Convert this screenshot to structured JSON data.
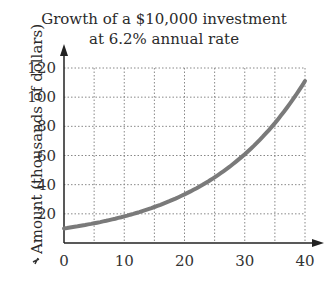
{
  "chart_data": {
    "type": "line",
    "title": "Growth of a $10,000 investment",
    "subtitle": "at 6.2% annual rate",
    "xlabel": "",
    "ylabel": "Amount (thousands of dollars)",
    "x_ticks": [
      "0",
      "10",
      "20",
      "30",
      "40"
    ],
    "y_ticks": [
      "20",
      "40",
      "60",
      "80",
      "100",
      "120"
    ],
    "xlim": [
      0,
      40
    ],
    "ylim": [
      0,
      120
    ],
    "grid": true,
    "grid_x_step": 5,
    "grid_y_step": 20,
    "series": [
      {
        "name": "Amount",
        "x": [
          0,
          5,
          10,
          15,
          20,
          25,
          30,
          35,
          40
        ],
        "values": [
          10.0,
          13.5,
          18.2,
          24.6,
          33.3,
          45.0,
          60.8,
          82.2,
          111.1
        ]
      }
    ],
    "colors": {
      "curve": "#7a7a7a",
      "axis": "#222222",
      "grid": "#888888"
    }
  }
}
